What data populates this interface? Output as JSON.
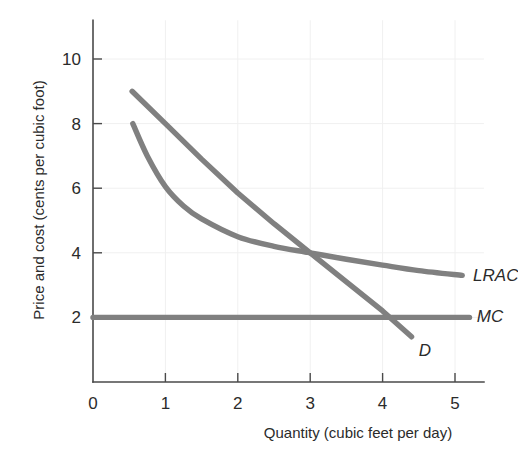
{
  "chart_data": {
    "type": "line",
    "title": "",
    "xlabel": "Quantity (cubic feet per day)",
    "ylabel": "Price and cost (cents per cubic foot)",
    "xlim": [
      0,
      5.4
    ],
    "ylim": [
      0,
      11.2
    ],
    "xticks": [
      0,
      1,
      2,
      3,
      4,
      5
    ],
    "xtick_labels": [
      "0",
      "1",
      "2",
      "3",
      "4",
      "5"
    ],
    "yticks": [
      2,
      4,
      6,
      8,
      10
    ],
    "ytick_labels": [
      "2",
      "4",
      "6",
      "8",
      "10"
    ],
    "grid": true,
    "legend_position": "inline-right-of-curve-end",
    "series": [
      {
        "name": "D",
        "label": "D",
        "color": "#808080",
        "kind": "line",
        "points": [
          [
            0.54,
            9.0
          ],
          [
            1.0,
            8.0
          ],
          [
            1.5,
            6.9
          ],
          [
            2.0,
            5.85
          ],
          [
            2.5,
            4.9
          ],
          [
            3.0,
            4.0
          ],
          [
            3.5,
            3.1
          ],
          [
            4.0,
            2.2
          ],
          [
            4.4,
            1.4
          ]
        ]
      },
      {
        "name": "LRAC",
        "label": "LRAC",
        "color": "#808080",
        "kind": "curve",
        "points": [
          [
            0.55,
            8.0
          ],
          [
            0.75,
            7.0
          ],
          [
            1.0,
            6.05
          ],
          [
            1.25,
            5.45
          ],
          [
            1.5,
            5.05
          ],
          [
            2.0,
            4.5
          ],
          [
            2.5,
            4.2
          ],
          [
            3.0,
            4.0
          ],
          [
            3.5,
            3.8
          ],
          [
            4.0,
            3.62
          ],
          [
            4.5,
            3.45
          ],
          [
            5.1,
            3.3
          ]
        ]
      },
      {
        "name": "MC",
        "label": "MC",
        "color": "#808080",
        "kind": "horizontal",
        "points": [
          [
            0.0,
            2.0
          ],
          [
            5.2,
            2.0
          ]
        ]
      }
    ],
    "annotations": [
      {
        "text": "LRAC",
        "x": 5.25,
        "y": 3.3
      },
      {
        "text": "MC",
        "x": 5.3,
        "y": 2.05
      },
      {
        "text": "D",
        "x": 4.5,
        "y": 1.0
      }
    ],
    "intersections": [
      {
        "curves": [
          "D",
          "LRAC"
        ],
        "x": 3.0,
        "y": 4.0
      },
      {
        "curves": [
          "D",
          "MC"
        ],
        "x": 4.0,
        "y": 2.0
      }
    ]
  }
}
